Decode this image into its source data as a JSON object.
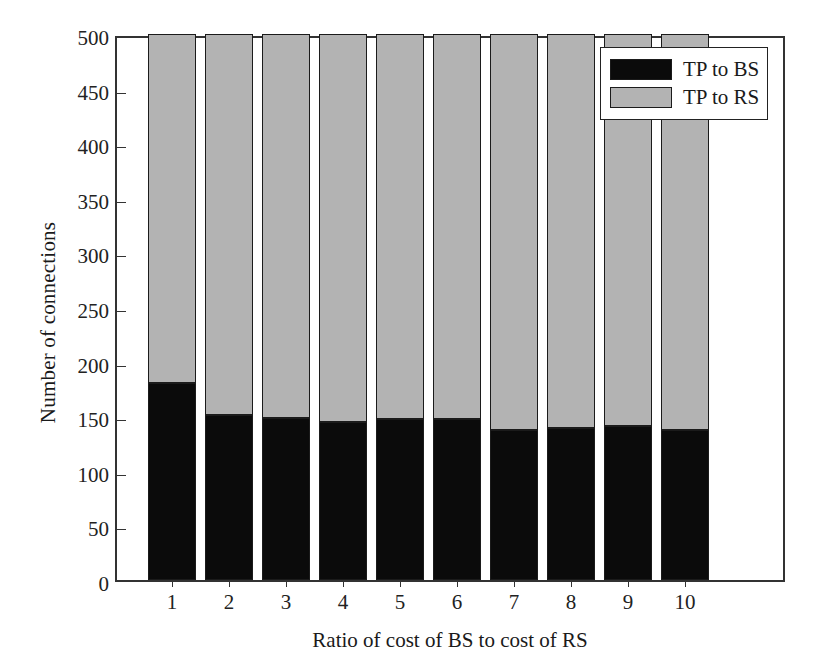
{
  "chart_data": {
    "type": "bar",
    "subtype": "stacked",
    "title": "",
    "xlabel": "Ratio of cost of BS to cost of RS",
    "ylabel": "Number of connections",
    "categories": [
      "1",
      "2",
      "3",
      "4",
      "5",
      "6",
      "7",
      "8",
      "9",
      "10"
    ],
    "series": [
      {
        "name": "TP to BS",
        "color": "#0b0b0b",
        "values": [
          180,
          151,
          148,
          145,
          147,
          147,
          137,
          139,
          141,
          137
        ]
      },
      {
        "name": "TP to RS",
        "color": "#b3b3b3",
        "values": [
          320,
          349,
          352,
          355,
          353,
          353,
          363,
          361,
          359,
          363
        ]
      }
    ],
    "stack_totals": [
      500,
      500,
      500,
      500,
      500,
      500,
      500,
      500,
      500,
      500
    ],
    "ylim": [
      0,
      500
    ],
    "yticks": [
      0,
      50,
      100,
      150,
      200,
      250,
      300,
      350,
      400,
      450,
      500
    ],
    "ytick_labels": [
      "0",
      "50",
      "100",
      "150",
      "200",
      "250",
      "300",
      "350",
      "400",
      "450",
      "500"
    ],
    "xtick_labels": [
      "1",
      "2",
      "3",
      "4",
      "5",
      "6",
      "7",
      "8",
      "9",
      "10"
    ],
    "grid": false,
    "legend_position": "top-right",
    "legend_entries": [
      "TP to BS",
      "TP to RS"
    ]
  },
  "legend": {
    "items": [
      {
        "label": "TP to BS",
        "swatch": "black-swatch"
      },
      {
        "label": "TP to RS",
        "swatch": "gray-swatch"
      }
    ]
  },
  "axes": {
    "x_title": "Ratio of cost of BS to cost of RS",
    "y_title": "Number of connections"
  }
}
